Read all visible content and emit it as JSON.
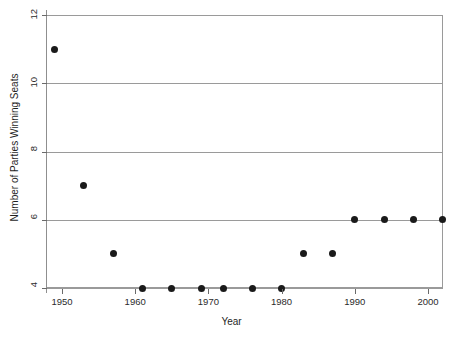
{
  "chart_data": {
    "type": "scatter",
    "title": "",
    "xlabel": "Year",
    "ylabel": "Number of Parties Winning Seats",
    "xlim": [
      1948,
      2002.5
    ],
    "ylim": [
      4,
      12
    ],
    "xticks": [
      1950,
      1960,
      1970,
      1980,
      1990,
      2000
    ],
    "xtick_labels": [
      "1950",
      "1960",
      "1970",
      "1980",
      "1990",
      "2000"
    ],
    "yticks": [
      4,
      6,
      8,
      10,
      12
    ],
    "ytick_labels": [
      "4",
      "6",
      "8",
      "10",
      "12"
    ],
    "grid": "horizontal",
    "legend": "none",
    "marker": "filled-circle",
    "marker_color": "#1a1a1a",
    "grid_color": "#9a9a9a",
    "background_color": "#ffffff",
    "x": [
      1949,
      1953,
      1957,
      1961,
      1965,
      1969,
      1972,
      1976,
      1980,
      1983,
      1987,
      1990,
      1994,
      1998,
      2002
    ],
    "y": [
      11,
      7,
      5,
      4,
      4,
      4,
      4,
      4,
      4,
      5,
      5,
      6,
      6,
      6,
      6
    ],
    "points": [
      {
        "x": 1949,
        "y": 11
      },
      {
        "x": 1953,
        "y": 7
      },
      {
        "x": 1957,
        "y": 5
      },
      {
        "x": 1961,
        "y": 4
      },
      {
        "x": 1965,
        "y": 4
      },
      {
        "x": 1969,
        "y": 4
      },
      {
        "x": 1972,
        "y": 4
      },
      {
        "x": 1976,
        "y": 4
      },
      {
        "x": 1980,
        "y": 4
      },
      {
        "x": 1983,
        "y": 5
      },
      {
        "x": 1987,
        "y": 5
      },
      {
        "x": 1990,
        "y": 6
      },
      {
        "x": 1994,
        "y": 6
      },
      {
        "x": 1998,
        "y": 6
      },
      {
        "x": 2002,
        "y": 6
      }
    ]
  }
}
